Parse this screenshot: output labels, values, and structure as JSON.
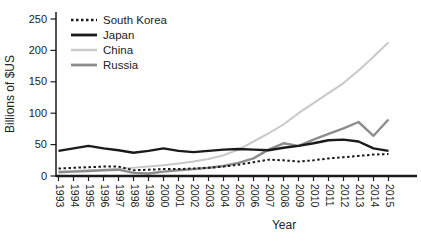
{
  "figure": {
    "background": "#ffffff",
    "axis_color": "#1a1a1a",
    "text_color": "#222222"
  },
  "chart_data": {
    "type": "line",
    "title": "",
    "xlabel": "Year",
    "ylabel": "Billions of $US",
    "x": [
      "1993",
      "1994",
      "1995",
      "1996",
      "1997",
      "1998",
      "1999",
      "2000",
      "2001",
      "2002",
      "2003",
      "2004",
      "2005",
      "2006",
      "2007",
      "2008",
      "2009",
      "2010",
      "2011",
      "2012",
      "2013",
      "2014",
      "2015"
    ],
    "ylim": [
      0,
      250
    ],
    "yticks": [
      0,
      50,
      100,
      150,
      200,
      250
    ],
    "grid": false,
    "legend_position": "inside-top-left",
    "series": [
      {
        "name": "South Korea",
        "color": "#1a1a1a",
        "dash": "dotted",
        "width": 2,
        "values": [
          12,
          13,
          14,
          15,
          15,
          9,
          10,
          11,
          11,
          12,
          13,
          15,
          18,
          22,
          26,
          25,
          23,
          25,
          28,
          30,
          32,
          34,
          35
        ]
      },
      {
        "name": "Japan",
        "color": "#1a1a1a",
        "dash": "solid",
        "width": 2.4,
        "values": [
          40,
          44,
          48,
          44,
          41,
          37,
          40,
          44,
          40,
          38,
          40,
          42,
          43,
          42,
          41,
          45,
          48,
          52,
          57,
          58,
          55,
          44,
          40
        ]
      },
      {
        "name": "China",
        "color": "#c9c9c9",
        "dash": "solid",
        "width": 2,
        "values": [
          7,
          8,
          9,
          10,
          11,
          13,
          15,
          17,
          20,
          23,
          27,
          33,
          42,
          55,
          68,
          82,
          100,
          116,
          132,
          148,
          168,
          190,
          213
        ]
      },
      {
        "name": "Russia",
        "color": "#8c8c8c",
        "dash": "solid",
        "width": 2.4,
        "values": [
          6,
          7,
          8,
          9,
          10,
          5,
          4,
          7,
          9,
          11,
          13,
          16,
          21,
          28,
          42,
          52,
          48,
          58,
          67,
          76,
          86,
          64,
          90
        ]
      }
    ]
  }
}
